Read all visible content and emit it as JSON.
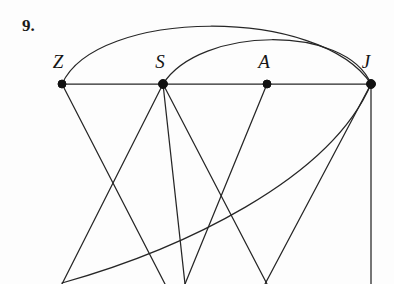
{
  "figure": {
    "problem_number": "9.",
    "width": 394,
    "height": 284,
    "background_color": "#fdfdfd",
    "stroke_color": "#262626",
    "vertex_color": "#111111",
    "label_color": "#151515"
  },
  "vertices": [
    {
      "id": "Z",
      "label": "Z",
      "x": 62,
      "y": 84,
      "label_x": 58,
      "label_y": 68,
      "radius": 4
    },
    {
      "id": "S",
      "label": "S",
      "x": 163,
      "y": 84,
      "label_x": 160,
      "label_y": 68,
      "radius": 4.5
    },
    {
      "id": "A",
      "label": "A",
      "x": 267,
      "y": 84,
      "label_x": 264,
      "label_y": 68,
      "radius": 4
    },
    {
      "id": "J",
      "label": "J",
      "x": 371,
      "y": 84,
      "label_x": 366,
      "label_y": 68,
      "radius": 4.5
    }
  ],
  "edges": [
    {
      "id": "edge-z-s",
      "from": "Z",
      "to": "S",
      "kind": "line",
      "path": "M 62 84 L 163 84"
    },
    {
      "id": "edge-s-a",
      "from": "S",
      "to": "A",
      "kind": "line",
      "path": "M 163 84 L 267 84"
    },
    {
      "id": "edge-a-j",
      "from": "A",
      "to": "J",
      "kind": "line",
      "path": "M 267 84 L 371 84"
    },
    {
      "id": "edge-z-j-arc",
      "from": "Z",
      "to": "J",
      "kind": "arc",
      "path": "M 62 84 C 96 8 320 6 371 84"
    },
    {
      "id": "edge-s-j-arc",
      "from": "S",
      "to": "J",
      "kind": "arc",
      "path": "M 163 84 C 200 26 346 24 371 84"
    },
    {
      "id": "edge-z-down",
      "from": "Z",
      "to": "bottom-mid",
      "kind": "line",
      "path": "M 62 84 L 165 284"
    },
    {
      "id": "edge-s-down-left",
      "from": "S",
      "to": "bottom-left",
      "kind": "line",
      "path": "M 163 84 L 62 284"
    },
    {
      "id": "edge-s-down-midleft",
      "from": "S",
      "to": "bottom-mid2",
      "kind": "line",
      "path": "M 163 84 L 185 284"
    },
    {
      "id": "edge-s-down-right",
      "from": "S",
      "to": "bottom-right",
      "kind": "line",
      "path": "M 163 84 L 267 284"
    },
    {
      "id": "edge-a-down",
      "from": "A",
      "to": "bottom-mid3",
      "kind": "line",
      "path": "M 267 84 L 185 284"
    },
    {
      "id": "edge-j-vertical",
      "from": "J",
      "to": "bottom-far-right",
      "kind": "line",
      "path": "M 371 84 L 371 284"
    },
    {
      "id": "edge-j-down-left",
      "from": "J",
      "to": "bottom-left2",
      "kind": "line",
      "path": "M 371 84 L 265 284"
    },
    {
      "id": "edge-j-curve-down",
      "from": "J",
      "to": "bottom-left-curve",
      "kind": "arc",
      "path": "M 371 84 C 330 180 180 250 62 283"
    }
  ],
  "legend": {
    "description": "Graph with four labeled vertices Z, S, A and J connected by straight segments and curved arcs."
  }
}
